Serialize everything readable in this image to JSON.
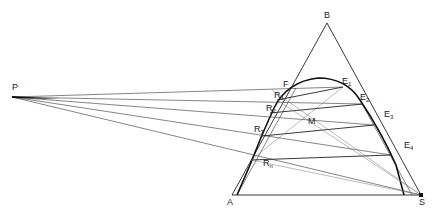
{
  "figure": {
    "type": "ternary extraction diagram (countercurrent, difference point construction)",
    "caption_fragment": ""
  },
  "points": {
    "P": {
      "label": "P",
      "x": 12,
      "y": 97
    },
    "B": {
      "label": "B",
      "x": 327,
      "y": 23
    },
    "A": {
      "label": "A",
      "x": 232,
      "y": 195
    },
    "S": {
      "label": "S",
      "x": 421,
      "y": 195
    },
    "F": {
      "label": "F",
      "x": 272,
      "y": 86
    },
    "M": {
      "label": "M",
      "x": 314,
      "y": 113
    },
    "R1": {
      "label": "R",
      "sub": "1",
      "x": 270,
      "y": 100
    },
    "R2": {
      "label": "R",
      "sub": "2",
      "x": 262,
      "y": 111
    },
    "R3": {
      "label": "R",
      "sub": "3",
      "x": 253,
      "y": 133
    },
    "Rn": {
      "label": "R",
      "sub": "n",
      "x": 244,
      "y": 156
    },
    "E1": {
      "label": "E",
      "sub": "1",
      "x": 343,
      "y": 87
    },
    "E2": {
      "label": "E",
      "sub": "2",
      "x": 363,
      "y": 104
    },
    "E3": {
      "label": "E",
      "sub": "3",
      "x": 374,
      "y": 125
    },
    "E4": {
      "label": "E",
      "sub": "4",
      "x": 391,
      "y": 155
    }
  },
  "labels": {
    "B": "B",
    "A": "A",
    "S": "S",
    "P": "P",
    "F": "F",
    "M": "M",
    "R": "R",
    "E": "E",
    "r1_sub": "1",
    "r2_sub": "2",
    "r3_sub": "3",
    "rn_sub": "n",
    "e1_sub": "1",
    "e2_sub": "2",
    "e3_sub": "3",
    "e4_sub": "4"
  }
}
